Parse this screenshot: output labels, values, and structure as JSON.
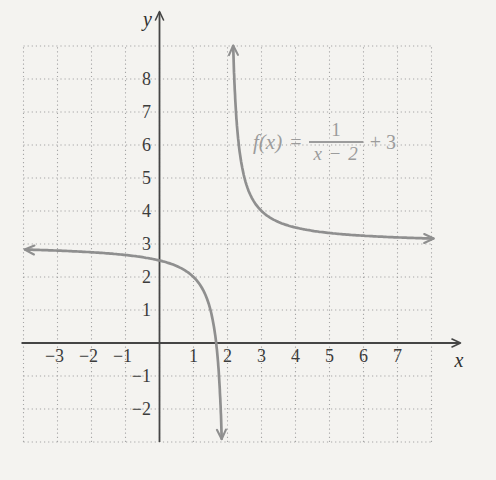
{
  "page": {
    "background": "#f4f3f0"
  },
  "chart_data": {
    "type": "line",
    "subtype": "function-plot",
    "title": "",
    "function": {
      "expression": "f(x) = 1/(x-2) + 3",
      "a": 1,
      "h": 2,
      "k": 3
    },
    "annotation": {
      "fx": "f(x)",
      "equals": "=",
      "numerator": "1",
      "denominator": "x − 2",
      "suffix": "+ 3"
    },
    "asymptotes": {
      "vertical_x": 2,
      "horizontal_y": 3
    },
    "x_range": [
      -4,
      8
    ],
    "y_range": [
      -3,
      9
    ],
    "grid": "dotted",
    "legend": "none",
    "xlabel": "x",
    "ylabel": "y",
    "x_ticks": [
      -3,
      -2,
      -1,
      1,
      2,
      3,
      4,
      5,
      6,
      7
    ],
    "y_ticks": [
      8,
      7,
      6,
      5,
      4,
      3,
      2,
      1,
      -1,
      -2
    ],
    "branches": [
      {
        "name": "left",
        "x_start": -3.95,
        "switch_x": 1.5,
        "y_end": -3,
        "arrows": [
          "start-left",
          "end-down"
        ],
        "points": [
          [
            -4,
            2.83
          ],
          [
            -3,
            2.8
          ],
          [
            -2,
            2.75
          ],
          [
            -1,
            2.67
          ],
          [
            0,
            2.5
          ],
          [
            1,
            2
          ],
          [
            1.5,
            1
          ],
          [
            1.83,
            -3
          ]
        ]
      },
      {
        "name": "right",
        "y_start": 9,
        "switch_x": 3,
        "x_end": 8.05,
        "arrows": [
          "start-up",
          "end-right"
        ],
        "points": [
          [
            2.17,
            9
          ],
          [
            2.5,
            5
          ],
          [
            3,
            4
          ],
          [
            4,
            3.5
          ],
          [
            5,
            3.33
          ],
          [
            6,
            3.25
          ],
          [
            7,
            3.2
          ],
          [
            8,
            3.17
          ]
        ]
      }
    ],
    "colors": {
      "curve": "#8f8f8f",
      "axis": "#454545",
      "grid_dots": "#a6a6a6",
      "tick_text": "#3c3c3c",
      "annotation_text": "#9c9c9c"
    }
  }
}
